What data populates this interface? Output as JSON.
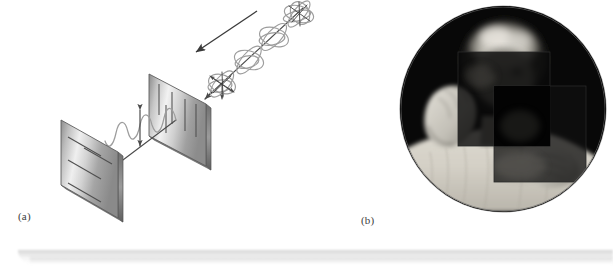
{
  "figure": {
    "background_color": "#ffffff",
    "width": 613,
    "height": 276
  },
  "panel_a": {
    "caption": "(a)",
    "description": "Diagram: unpolarized light travels toward a vertical-axis polarizer, emerges linearly polarized, and strikes a second horizontal-axis polarizer",
    "incoming_beam": {
      "label_name": "unpolarized-light-beam",
      "direction_arrow_name": "propagation-direction-arrow",
      "wave_color": "#8e8e8e",
      "axis_color": "#4a4a4a"
    },
    "polarizer_front": {
      "name": "polarizer-analyzer-horizontal",
      "axis_orientation": "horizontal",
      "line_count": 4,
      "face_color_light": "#f2f2f2",
      "face_color_dark": "#9a9a9a",
      "edge_color": "#5a5a5a"
    },
    "polarizer_back": {
      "name": "polarizer-vertical",
      "axis_orientation": "vertical",
      "line_count": 5,
      "face_color_light": "#f4f4f4",
      "face_color_dark": "#8f8f8f",
      "edge_color": "#5a5a5a"
    },
    "polarized_beam": {
      "label_name": "linearly-polarized-beam",
      "oscillation_arrow_name": "polarization-direction-arrow",
      "wave_color": "#9a9a9a"
    }
  },
  "panel_b": {
    "caption": "(b)",
    "description": "Photograph: a person holding two overlapping polarizing sheets in front of their face; the crossed overlap region is opaque black",
    "photo": {
      "name": "crossed-polarizers-photograph",
      "shape": "circle",
      "filter_upper_name": "polarizing-sheet-upper",
      "filter_lower_name": "polarizing-sheet-lower",
      "overlap_name": "crossed-overlap-region",
      "background_color": "#070707",
      "sweater_color": "#d8d5cc"
    }
  }
}
